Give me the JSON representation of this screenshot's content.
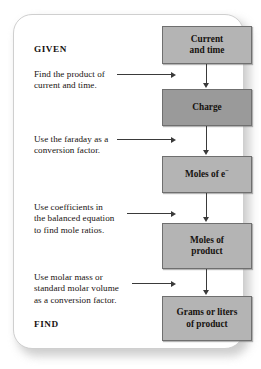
{
  "diagram": {
    "given_label": "GIVEN",
    "find_label": "FIND",
    "colors": {
      "box_fill": "#b4b4b4",
      "box_fill_dark": "#9a9a9a",
      "box_border": "#6f6f6f",
      "arrow": "#3a3a3a",
      "card_border": "#cfcfcf",
      "text": "#16120f"
    },
    "boxes": [
      {
        "id": "current-and-time",
        "lines": [
          "Current",
          "and time"
        ],
        "fill": "#b4b4b4"
      },
      {
        "id": "charge",
        "lines": [
          "Charge"
        ],
        "fill": "#9a9a9a"
      },
      {
        "id": "moles-of-electrons",
        "lines": [
          "Moles of e"
        ],
        "superscript": "−",
        "fill": "#b4b4b4"
      },
      {
        "id": "moles-of-product",
        "lines": [
          "Moles of",
          "product"
        ],
        "fill": "#b4b4b4"
      },
      {
        "id": "grams-or-liters-of-product",
        "lines": [
          "Grams or liters",
          "of product"
        ],
        "fill": "#b4b4b4"
      }
    ],
    "steps": [
      {
        "id": "step-1",
        "lines": [
          "Find the product of",
          "current and time."
        ]
      },
      {
        "id": "step-2",
        "lines": [
          "Use the faraday as a",
          "conversion factor."
        ]
      },
      {
        "id": "step-3",
        "lines": [
          "Use coefficients in",
          "the balanced equation",
          "to find mole ratios."
        ]
      },
      {
        "id": "step-4",
        "lines": [
          "Use molar mass or",
          "standard molar volume",
          "as a conversion factor."
        ]
      }
    ]
  }
}
